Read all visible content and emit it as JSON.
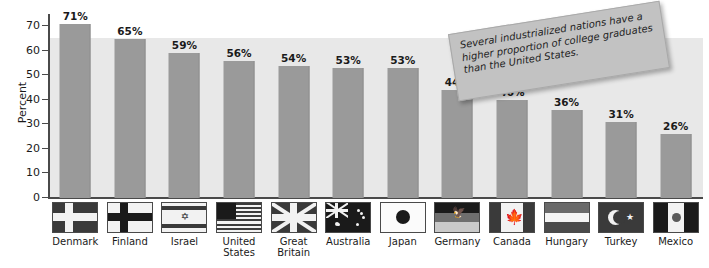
{
  "chart_data": {
    "type": "bar",
    "title": "",
    "xlabel": "",
    "ylabel": "Percent",
    "ylim": [
      0,
      75
    ],
    "yticks": [
      0,
      10,
      20,
      30,
      40,
      50,
      60,
      70
    ],
    "grid": false,
    "legend": "none",
    "value_suffix": "%",
    "categories": [
      "Denmark",
      "Finland",
      "Israel",
      "United States",
      "Great Britain",
      "Australia",
      "Japan",
      "Germany",
      "Canada",
      "Hungary",
      "Turkey",
      "Mexico"
    ],
    "values": [
      71,
      65,
      59,
      56,
      54,
      53,
      53,
      44,
      40,
      36,
      31,
      26
    ],
    "value_labels": [
      "71%",
      "65%",
      "59%",
      "56%",
      "54%",
      "53%",
      "53%",
      "44%",
      "40%",
      "36%",
      "31%",
      "26%"
    ],
    "annotations": [
      {
        "name": "callout-note",
        "text": "Several industrialized nations have a higher proportion of college graduates than the United States.",
        "rotation_deg": -9
      }
    ],
    "colors": {
      "bar": "#9a9a9a",
      "plot_background": "#e8e8e8",
      "page_background": "#ffffff",
      "axis": "#4a4a4a",
      "text": "#1a1a1a",
      "note_background": "#c2c2c2"
    }
  },
  "axis": {
    "y_label": "Percent",
    "y_ticks": [
      "70",
      "60",
      "50",
      "40",
      "30",
      "20",
      "10",
      "0"
    ]
  },
  "flags": [
    {
      "country": "Denmark",
      "icon": "flag-denmark-icon"
    },
    {
      "country": "Finland",
      "icon": "flag-finland-icon"
    },
    {
      "country": "Israel",
      "icon": "flag-israel-icon"
    },
    {
      "country": "United States",
      "icon": "flag-united-states-icon"
    },
    {
      "country": "Great Britain",
      "icon": "flag-great-britain-icon"
    },
    {
      "country": "Australia",
      "icon": "flag-australia-icon"
    },
    {
      "country": "Japan",
      "icon": "flag-japan-icon"
    },
    {
      "country": "Germany",
      "icon": "flag-germany-icon"
    },
    {
      "country": "Canada",
      "icon": "flag-canada-icon"
    },
    {
      "country": "Hungary",
      "icon": "flag-hungary-icon"
    },
    {
      "country": "Turkey",
      "icon": "flag-turkey-icon"
    },
    {
      "country": "Mexico",
      "icon": "flag-mexico-icon"
    }
  ],
  "note": {
    "text": "Several industrialized nations have a higher proportion of college graduates than the United States."
  }
}
